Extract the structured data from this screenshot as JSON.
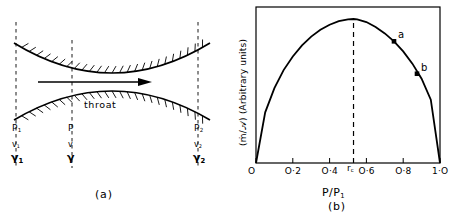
{
  "figure": {
    "panel_a": {
      "caption": "(a)",
      "throat_label": "throat",
      "flow_arrow": "flow-direction-arrow",
      "stations": [
        {
          "id": "station-1",
          "x": 16,
          "pressure": "P",
          "pressure_sub": "1",
          "velocity": "v",
          "velocity_sub": "1",
          "specific_volume": "γ",
          "specific_volume_sub": "1"
        },
        {
          "id": "station-mid",
          "x": 72,
          "pressure": "P",
          "pressure_sub": "",
          "velocity": "v",
          "velocity_sub": "",
          "specific_volume": "γ",
          "specific_volume_sub": ""
        },
        {
          "id": "station-2",
          "x": 198,
          "pressure": "P",
          "pressure_sub": "2",
          "velocity": "v",
          "velocity_sub": "2",
          "specific_volume": "γ",
          "specific_volume_sub": "2"
        }
      ]
    },
    "panel_b": {
      "caption": "(b)",
      "critical_ratio_label": "r",
      "critical_ratio_sub": "c"
    }
  },
  "chart_data": {
    "type": "line",
    "title": "",
    "ylabel": "(ṁ/𝒜) (Arbitrary units)",
    "xlabel": "P/P",
    "xlabel_sub": "1",
    "xlim": [
      0,
      1
    ],
    "ylim": [
      0,
      1
    ],
    "grid": false,
    "legend": "none",
    "xtick_labels": [
      "O",
      "O·2",
      "O·4",
      "O·6",
      "O·8",
      "1·O"
    ],
    "xtick_values": [
      0,
      0.2,
      0.4,
      0.6,
      0.8,
      1.0
    ],
    "ytick_labels": [],
    "critical_pressure_ratio": 0.53,
    "annotations": [
      {
        "label": "a",
        "x": 0.75,
        "y": 0.845
      },
      {
        "label": "b",
        "x": 0.875,
        "y": 0.62
      }
    ],
    "x": [
      0.0,
      0.05,
      0.1,
      0.15,
      0.2,
      0.25,
      0.3,
      0.35,
      0.4,
      0.45,
      0.5,
      0.53,
      0.55,
      0.6,
      0.65,
      0.7,
      0.75,
      0.8,
      0.85,
      0.9,
      0.95,
      1.0
    ],
    "y": [
      0.0,
      0.352,
      0.52,
      0.645,
      0.74,
      0.817,
      0.878,
      0.925,
      0.96,
      0.985,
      0.998,
      1.0,
      0.998,
      0.979,
      0.945,
      0.9,
      0.845,
      0.775,
      0.69,
      0.585,
      0.44,
      0.0
    ]
  }
}
